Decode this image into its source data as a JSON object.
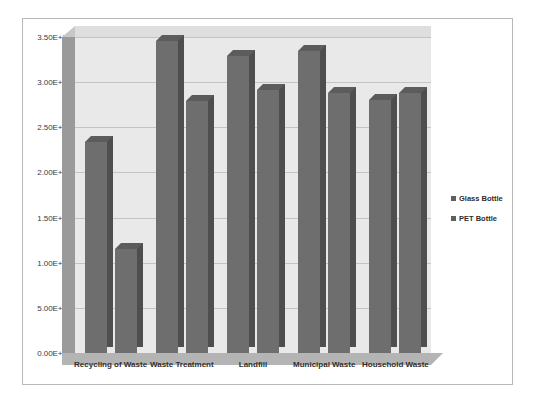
{
  "chart_data": {
    "type": "bar",
    "title": "",
    "subtitle": "",
    "xlabel": "",
    "ylabel": "",
    "categories": [
      "Recycling of Waste",
      "Waste Treatment",
      "Landfill",
      "Municipal Waste",
      "Household Waste"
    ],
    "series": [
      {
        "name": "Glass Bottle",
        "color": "#6e6e6e",
        "values": [
          23400000000,
          34600000000,
          32900000000,
          33500000000,
          28000000000
        ]
      },
      {
        "name": "PET Bottle",
        "color": "#6e6e6e",
        "values": [
          11500000000,
          27900000000,
          29100000000,
          28800000000,
          28800000000
        ]
      }
    ],
    "ylim": [
      0,
      35000000000
    ],
    "ytick_values": [
      0,
      5000000000,
      10000000000,
      15000000000,
      20000000000,
      25000000000,
      30000000000,
      35000000000
    ],
    "ytick_labels": [
      "0.00E+00",
      "5.00E+09",
      "1.00E+10",
      "1.50E+10",
      "2.00E+10",
      "2.50E+10",
      "3.00E+10",
      "3.50E+10"
    ],
    "grid": true,
    "grid_axis": "y",
    "legend_position": "right",
    "style": "3d-column",
    "plot_background": "#e9e9e9",
    "gridline_color": "#c4c4c4",
    "border_color": "#b8b8b8"
  },
  "legend": {
    "entries": [
      {
        "label": "Glass Bottle",
        "marker": "square-swatch"
      },
      {
        "label": "PET Bottle",
        "marker": "square-swatch"
      }
    ]
  }
}
